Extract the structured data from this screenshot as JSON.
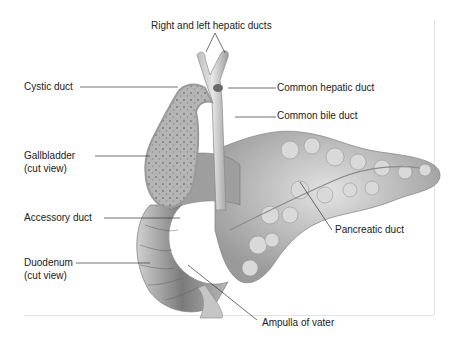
{
  "diagram": {
    "labels": {
      "hepatic_ducts": "Right and left hepatic ducts",
      "cystic_duct": "Cystic duct",
      "common_hepatic_duct": "Common hepatic duct",
      "common_bile_duct": "Common bile duct",
      "gallbladder_1": "Gallbladder",
      "gallbladder_2": "(cut view)",
      "accessory_duct": "Accessory duct",
      "pancreatic_duct": "Pancreatic duct",
      "duodenum_1": "Duodenum",
      "duodenum_2": "(cut view)",
      "ampulla": "Ampulla of vater"
    },
    "colors": {
      "organ_light": "#d4d4d4",
      "organ_mid": "#a8a8a8",
      "organ_dark": "#6e6e6e",
      "leader": "#333333",
      "text": "#222222"
    }
  }
}
